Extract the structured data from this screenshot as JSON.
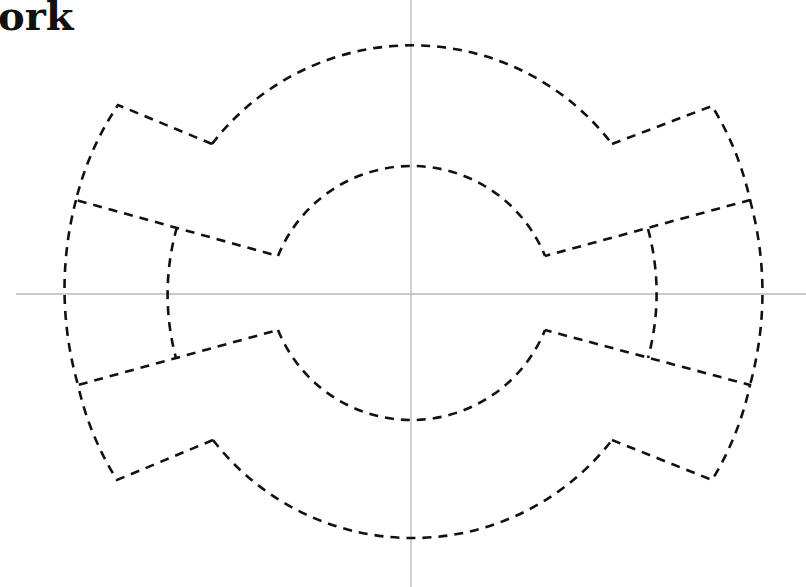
{
  "title": "ork",
  "diagram": {
    "type": "dashed-outline-figure",
    "center": [
      411,
      294
    ],
    "outer_radius": 252,
    "inner_radius": 144,
    "middle_arc_radius": 246,
    "axes": {
      "horizontal_y": 294,
      "vertical_x": 411,
      "color": "#b8b8b8"
    },
    "stroke_color": "#111111",
    "background": "#ffffff"
  }
}
